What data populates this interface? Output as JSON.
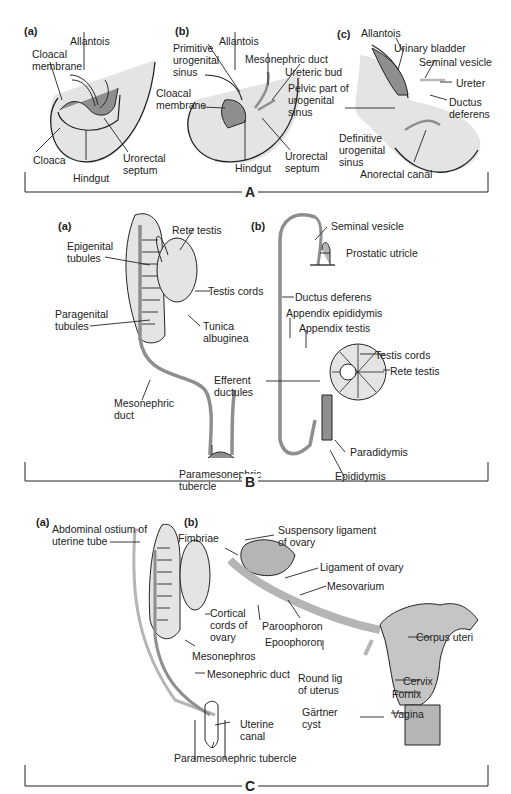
{
  "colors": {
    "light_tissue": "#e4e4e4",
    "dark_tissue": "#8e8e8e",
    "mid_tissue": "#b5b5b5",
    "line": "#222222"
  },
  "panels": {
    "A": {
      "label": "A",
      "a": {
        "tag": "(a)",
        "labels": {
          "allantois": "Allantois",
          "cloacal_membrane": "Cloacal\nmembrane",
          "cloaca": "Cloaca",
          "hindgut": "Hindgut",
          "urorectal_septum": "Urorectal\nseptum"
        }
      },
      "b": {
        "tag": "(b)",
        "labels": {
          "primitive_urogenital_sinus": "Primitive\nurogenital\nsinus",
          "allantois": "Allantois",
          "mesonephric_duct": "Mesonephric duct",
          "ureteric_bud": "Ureteric bud",
          "cloacal_membrane": "Cloacal\nmembrane",
          "hindgut": "Hindgut",
          "urorectal_septum": "Urorectal\nseptum"
        }
      },
      "c": {
        "tag": "(c)",
        "labels": {
          "allantois": "Allantois",
          "urinary_bladder": "Urinary bladder",
          "seminal_vesicle": "Seminal vesicle",
          "ureter": "Ureter",
          "pelvic_part": "Pelvic part of\nurogenital\nsinus",
          "ductus_deferens": "Ductus\ndeferens",
          "definitive_sinus": "Definitive\nurogenital\nsinus",
          "anorectal_canal": "Anorectal canal"
        }
      }
    },
    "B": {
      "label": "B",
      "a": {
        "tag": "(a)",
        "labels": {
          "rete_testis": "Rete testis",
          "epigenital_tubules": "Epigenital\ntubules",
          "testis_cords": "Testis cords",
          "paragenital_tubules": "Paragenital\ntubules",
          "tunica_albuginea": "Tunica\nalbuginea",
          "mesonephric_duct": "Mesonephric\nduct",
          "paramesonephric_tubercle": "Paramesonephric\ntubercle"
        }
      },
      "b": {
        "tag": "(b)",
        "labels": {
          "seminal_vesicle": "Seminal vesicle",
          "prostatic_utricle": "Prostatic utricle",
          "ductus_deferens": "Ductus deferens",
          "appendix_epididymis": "Appendix epididymis",
          "appendix_testis": "Appendix testis",
          "testis_cords": "Testis cords",
          "rete_testis": "Rete testis",
          "efferent_ductules": "Efferent\nductules",
          "paradidymis": "Paradidymis",
          "epididymis": "Epididymis"
        }
      }
    },
    "C": {
      "label": "C",
      "a": {
        "tag": "(a)",
        "labels": {
          "abdominal_ostium": "Abdominal ostium of\nuterine tube",
          "cortical_cords": "Cortical\ncords of\novary",
          "mesonephros": "Mesonephros",
          "mesonephric_duct": "Mesonephric duct",
          "uterine_canal": "Uterine\ncanal",
          "paramesonephric_tubercle": "Paramesonephric tubercle"
        }
      },
      "b": {
        "tag": "(b)",
        "labels": {
          "fimbriae": "Fimbriae",
          "suspensory_ligament": "Suspensory ligament\nof ovary",
          "ligament_of_ovary": "Ligament of ovary",
          "mesovarium": "Mesovarium",
          "paroophoron": "Paroophoron",
          "epoophoron": "Epoophoron",
          "corpus_uteri": "Corpus uteri",
          "round_lig": "Round lig\nof uterus",
          "cervix": "Cervix",
          "fornix": "Fornix",
          "gartner_cyst": "Gärtner\ncyst",
          "vagina": "Vagina"
        }
      }
    }
  }
}
